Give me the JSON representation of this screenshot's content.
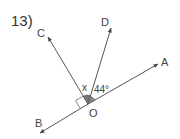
{
  "problem": {
    "number": "13)",
    "points": {
      "A": "A",
      "B": "B",
      "C": "C",
      "D": "D",
      "O": "O"
    },
    "angle_labels": {
      "x": "x",
      "given": "44°"
    },
    "colors": {
      "line": "#555555",
      "angle_fill": "#777777",
      "text": "#444444"
    }
  }
}
